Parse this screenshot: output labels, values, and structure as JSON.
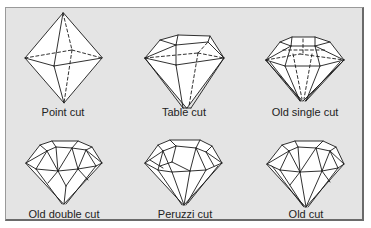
{
  "diagram": {
    "title": "",
    "background_color": "#e4e4e4",
    "line_color": "#1a1a1a",
    "facet_fill": "#ffffff",
    "cuts": [
      {
        "id": "point",
        "label": "Point cut",
        "row": 1,
        "col": 1
      },
      {
        "id": "table",
        "label": "Table cut",
        "row": 1,
        "col": 2
      },
      {
        "id": "old-single",
        "label": "Old single cut",
        "row": 1,
        "col": 3
      },
      {
        "id": "old-double",
        "label": "Old double cut",
        "row": 2,
        "col": 1
      },
      {
        "id": "peruzzi",
        "label": "Peruzzi cut",
        "row": 2,
        "col": 2
      },
      {
        "id": "old",
        "label": "Old cut",
        "row": 2,
        "col": 3
      }
    ]
  }
}
